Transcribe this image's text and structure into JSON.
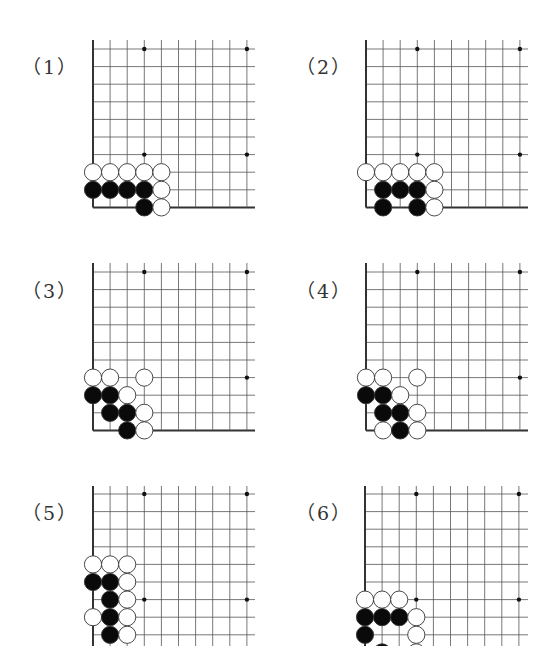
{
  "theme": {
    "line_color": "#555555",
    "edge_color": "#333333",
    "black_stone": "#0a0a0a",
    "white_stone": "#ffffff",
    "stone_stroke": "#333333",
    "star_color": "#111111"
  },
  "grid": {
    "cols": 10,
    "rows_visible": 10,
    "spacing_x": 17.1,
    "spacing_y": 17.6,
    "stone_radius": 8.6,
    "star_points": [
      [
        3,
        0
      ],
      [
        9,
        0
      ],
      [
        3,
        6
      ],
      [
        9,
        6
      ]
    ]
  },
  "problems": [
    {
      "label": "（1）",
      "label_pos": [
        22,
        52
      ],
      "origin": [
        93,
        49
      ],
      "right_extent": 255,
      "top_extent": 40,
      "bottom_edge": true,
      "rows": 10,
      "stones": [
        {
          "c": 0,
          "r": 7,
          "color": "white"
        },
        {
          "c": 1,
          "r": 7,
          "color": "white"
        },
        {
          "c": 2,
          "r": 7,
          "color": "white"
        },
        {
          "c": 3,
          "r": 7,
          "color": "white"
        },
        {
          "c": 4,
          "r": 7,
          "color": "white"
        },
        {
          "c": 0,
          "r": 8,
          "color": "black"
        },
        {
          "c": 1,
          "r": 8,
          "color": "black"
        },
        {
          "c": 2,
          "r": 8,
          "color": "black"
        },
        {
          "c": 3,
          "r": 8,
          "color": "black"
        },
        {
          "c": 4,
          "r": 8,
          "color": "white"
        },
        {
          "c": 3,
          "r": 9,
          "color": "black"
        },
        {
          "c": 4,
          "r": 9,
          "color": "white"
        }
      ]
    },
    {
      "label": "（2）",
      "label_pos": [
        296,
        52
      ],
      "origin": [
        366,
        49
      ],
      "right_extent": 528,
      "top_extent": 40,
      "bottom_edge": true,
      "rows": 10,
      "stones": [
        {
          "c": 0,
          "r": 7,
          "color": "white"
        },
        {
          "c": 1,
          "r": 7,
          "color": "white"
        },
        {
          "c": 2,
          "r": 7,
          "color": "white"
        },
        {
          "c": 3,
          "r": 7,
          "color": "white"
        },
        {
          "c": 4,
          "r": 7,
          "color": "white"
        },
        {
          "c": 1,
          "r": 8,
          "color": "black"
        },
        {
          "c": 2,
          "r": 8,
          "color": "black"
        },
        {
          "c": 3,
          "r": 8,
          "color": "black"
        },
        {
          "c": 4,
          "r": 8,
          "color": "white"
        },
        {
          "c": 1,
          "r": 9,
          "color": "black"
        },
        {
          "c": 3,
          "r": 9,
          "color": "black"
        },
        {
          "c": 4,
          "r": 9,
          "color": "white"
        }
      ]
    },
    {
      "label": "（3）",
      "label_pos": [
        22,
        276
      ],
      "origin": [
        93,
        272
      ],
      "right_extent": 255,
      "top_extent": 263,
      "bottom_edge": true,
      "rows": 10,
      "stones": [
        {
          "c": 0,
          "r": 6,
          "color": "white"
        },
        {
          "c": 1,
          "r": 6,
          "color": "white"
        },
        {
          "c": 3,
          "r": 6,
          "color": "white"
        },
        {
          "c": 0,
          "r": 7,
          "color": "black"
        },
        {
          "c": 1,
          "r": 7,
          "color": "black"
        },
        {
          "c": 2,
          "r": 7,
          "color": "white"
        },
        {
          "c": 1,
          "r": 8,
          "color": "black"
        },
        {
          "c": 2,
          "r": 8,
          "color": "black"
        },
        {
          "c": 3,
          "r": 8,
          "color": "white"
        },
        {
          "c": 2,
          "r": 9,
          "color": "black"
        },
        {
          "c": 3,
          "r": 9,
          "color": "white"
        }
      ]
    },
    {
      "label": "（4）",
      "label_pos": [
        296,
        276
      ],
      "origin": [
        366,
        272
      ],
      "right_extent": 528,
      "top_extent": 263,
      "bottom_edge": true,
      "rows": 10,
      "stones": [
        {
          "c": 0,
          "r": 6,
          "color": "white"
        },
        {
          "c": 1,
          "r": 6,
          "color": "white"
        },
        {
          "c": 3,
          "r": 6,
          "color": "white"
        },
        {
          "c": 0,
          "r": 7,
          "color": "black"
        },
        {
          "c": 1,
          "r": 7,
          "color": "black"
        },
        {
          "c": 2,
          "r": 7,
          "color": "white"
        },
        {
          "c": 1,
          "r": 8,
          "color": "black"
        },
        {
          "c": 2,
          "r": 8,
          "color": "black"
        },
        {
          "c": 3,
          "r": 8,
          "color": "white"
        },
        {
          "c": 1,
          "r": 9,
          "color": "white"
        },
        {
          "c": 2,
          "r": 9,
          "color": "black"
        },
        {
          "c": 3,
          "r": 9,
          "color": "white"
        }
      ]
    },
    {
      "label": "（5）",
      "label_pos": [
        22,
        498
      ],
      "origin": [
        93,
        494
      ],
      "right_extent": 255,
      "top_extent": 486,
      "bottom_edge": false,
      "rows": 10,
      "stones": [
        {
          "c": 0,
          "r": 4,
          "color": "white"
        },
        {
          "c": 1,
          "r": 4,
          "color": "white"
        },
        {
          "c": 2,
          "r": 4,
          "color": "white"
        },
        {
          "c": 0,
          "r": 5,
          "color": "black"
        },
        {
          "c": 1,
          "r": 5,
          "color": "black"
        },
        {
          "c": 2,
          "r": 5,
          "color": "white"
        },
        {
          "c": 1,
          "r": 6,
          "color": "black"
        },
        {
          "c": 2,
          "r": 6,
          "color": "white"
        },
        {
          "c": 0,
          "r": 7,
          "color": "white"
        },
        {
          "c": 1,
          "r": 7,
          "color": "black"
        },
        {
          "c": 2,
          "r": 7,
          "color": "white"
        },
        {
          "c": 1,
          "r": 8,
          "color": "black"
        },
        {
          "c": 2,
          "r": 8,
          "color": "white"
        }
      ]
    },
    {
      "label": "（6）",
      "label_pos": [
        296,
        498
      ],
      "origin": [
        365,
        494
      ],
      "right_extent": 528,
      "top_extent": 486,
      "bottom_edge": false,
      "rows": 10,
      "stones": [
        {
          "c": 0,
          "r": 6,
          "color": "white"
        },
        {
          "c": 1,
          "r": 6,
          "color": "white"
        },
        {
          "c": 2,
          "r": 6,
          "color": "white"
        },
        {
          "c": 0,
          "r": 7,
          "color": "black"
        },
        {
          "c": 1,
          "r": 7,
          "color": "black"
        },
        {
          "c": 2,
          "r": 7,
          "color": "black"
        },
        {
          "c": 3,
          "r": 7,
          "color": "white"
        },
        {
          "c": 0,
          "r": 8,
          "color": "black"
        },
        {
          "c": 3,
          "r": 8,
          "color": "white"
        },
        {
          "c": 1,
          "r": 9,
          "color": "black"
        },
        {
          "c": 3,
          "r": 9,
          "color": "white"
        }
      ]
    }
  ]
}
